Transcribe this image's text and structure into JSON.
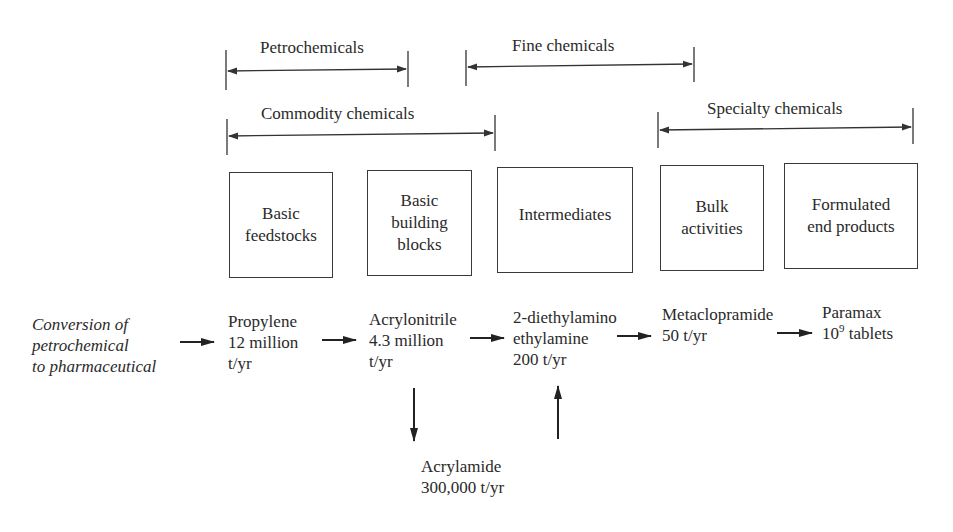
{
  "brackets": {
    "petrochemicals": "Petrochemicals",
    "fine_chemicals": "Fine chemicals",
    "commodity_chemicals": "Commodity chemicals",
    "specialty_chemicals": "Specialty chemicals"
  },
  "boxes": [
    {
      "lines": [
        "Basic",
        "feedstocks"
      ]
    },
    {
      "lines": [
        "Basic",
        "building",
        "blocks"
      ]
    },
    {
      "lines": [
        "Intermediates"
      ]
    },
    {
      "lines": [
        "Bulk",
        "activities"
      ]
    },
    {
      "lines": [
        "Formulated",
        "end products"
      ]
    }
  ],
  "flow": {
    "intro": [
      "Conversion of",
      "petrochemical",
      "to pharmaceutical"
    ],
    "propylene": [
      "Propylene",
      "12 million",
      "t/yr"
    ],
    "acrylonitrile": [
      "Acrylonitrile",
      "4.3 million",
      "t/yr"
    ],
    "diethylamino": [
      "2-diethylamino",
      "ethylamine",
      "200 t/yr"
    ],
    "metaclopramide": [
      "Metaclopramide",
      "50 t/yr"
    ],
    "paramax": {
      "name": "Paramax",
      "base": "10",
      "exponent": "9",
      "unit": " tablets"
    },
    "acrylamide": [
      "Acrylamide",
      "300,000 t/yr"
    ]
  },
  "colors": {
    "line": "#333333",
    "text": "#2a2a2a"
  }
}
